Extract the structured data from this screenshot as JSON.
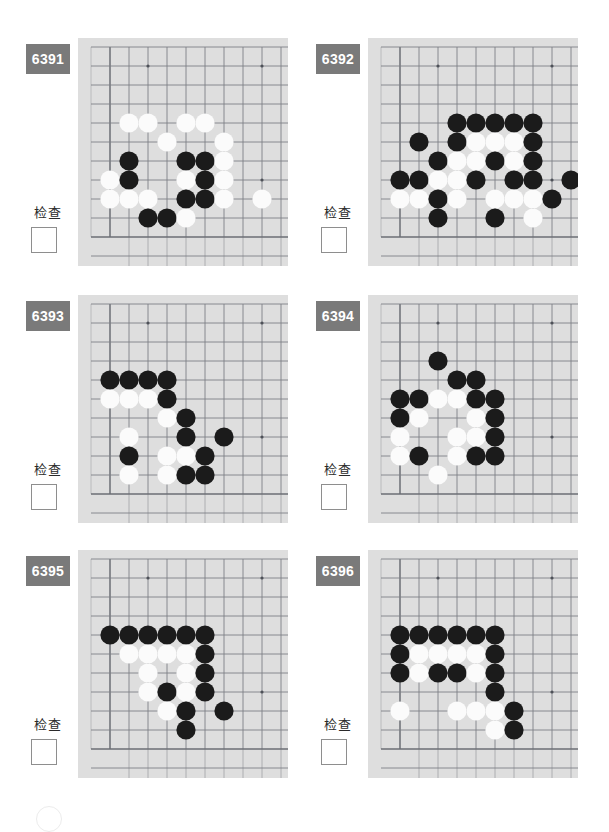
{
  "page": {
    "width": 609,
    "height": 820,
    "background": "#ffffff",
    "columns": 2,
    "rows": 3
  },
  "style": {
    "badge_bg": "#7a7a7a",
    "badge_text_color": "#ffffff",
    "board_bg": "#dedede",
    "board_line_color": "#7d8087",
    "board_edge_color": "#6b6e75",
    "stone_black": "#1b1b1b",
    "stone_white": "#fbfbfb",
    "checkbox_border": "#8e8e8e"
  },
  "board_meta": {
    "cols": 10,
    "rows": 11,
    "cell": 19,
    "stone_radius": 9.6,
    "origin_x": 13,
    "origin_y": 9,
    "edge_left_col": 1,
    "edge_bottom_row": 10,
    "star_points": [
      [
        3,
        1
      ],
      [
        9,
        1
      ],
      [
        9,
        7
      ]
    ]
  },
  "common": {
    "check_label": "检查",
    "checkbox_value": ""
  },
  "panels": [
    {
      "id": "6391",
      "label": "6391",
      "check_label": "检查",
      "x": 20,
      "y": 38,
      "stones": [
        {
          "c": 2,
          "r": 4,
          "color": "white"
        },
        {
          "c": 3,
          "r": 4,
          "color": "white"
        },
        {
          "c": 5,
          "r": 4,
          "color": "white"
        },
        {
          "c": 6,
          "r": 4,
          "color": "white"
        },
        {
          "c": 4,
          "r": 5,
          "color": "white"
        },
        {
          "c": 7,
          "r": 5,
          "color": "white"
        },
        {
          "c": 2,
          "r": 6,
          "color": "black"
        },
        {
          "c": 5,
          "r": 6,
          "color": "black"
        },
        {
          "c": 6,
          "r": 6,
          "color": "black"
        },
        {
          "c": 7,
          "r": 6,
          "color": "white"
        },
        {
          "c": 1,
          "r": 7,
          "color": "white"
        },
        {
          "c": 2,
          "r": 7,
          "color": "black"
        },
        {
          "c": 5,
          "r": 7,
          "color": "white"
        },
        {
          "c": 6,
          "r": 7,
          "color": "black"
        },
        {
          "c": 7,
          "r": 7,
          "color": "white"
        },
        {
          "c": 1,
          "r": 8,
          "color": "white"
        },
        {
          "c": 2,
          "r": 8,
          "color": "white"
        },
        {
          "c": 3,
          "r": 8,
          "color": "white"
        },
        {
          "c": 5,
          "r": 8,
          "color": "black"
        },
        {
          "c": 6,
          "r": 8,
          "color": "black"
        },
        {
          "c": 7,
          "r": 8,
          "color": "white"
        },
        {
          "c": 9,
          "r": 8,
          "color": "white"
        },
        {
          "c": 3,
          "r": 9,
          "color": "black"
        },
        {
          "c": 4,
          "r": 9,
          "color": "black"
        },
        {
          "c": 5,
          "r": 9,
          "color": "white"
        }
      ]
    },
    {
      "id": "6392",
      "label": "6392",
      "check_label": "检查",
      "x": 310,
      "y": 38,
      "stones": [
        {
          "c": 4,
          "r": 4,
          "color": "black"
        },
        {
          "c": 5,
          "r": 4,
          "color": "black"
        },
        {
          "c": 6,
          "r": 4,
          "color": "black"
        },
        {
          "c": 7,
          "r": 4,
          "color": "black"
        },
        {
          "c": 8,
          "r": 4,
          "color": "black"
        },
        {
          "c": 2,
          "r": 5,
          "color": "black"
        },
        {
          "c": 4,
          "r": 5,
          "color": "black"
        },
        {
          "c": 5,
          "r": 5,
          "color": "white"
        },
        {
          "c": 6,
          "r": 5,
          "color": "white"
        },
        {
          "c": 7,
          "r": 5,
          "color": "white"
        },
        {
          "c": 8,
          "r": 5,
          "color": "black"
        },
        {
          "c": 3,
          "r": 6,
          "color": "black"
        },
        {
          "c": 4,
          "r": 6,
          "color": "white"
        },
        {
          "c": 5,
          "r": 6,
          "color": "white"
        },
        {
          "c": 6,
          "r": 6,
          "color": "black"
        },
        {
          "c": 7,
          "r": 6,
          "color": "white"
        },
        {
          "c": 8,
          "r": 6,
          "color": "black"
        },
        {
          "c": 1,
          "r": 7,
          "color": "black"
        },
        {
          "c": 2,
          "r": 7,
          "color": "black"
        },
        {
          "c": 3,
          "r": 7,
          "color": "white"
        },
        {
          "c": 4,
          "r": 7,
          "color": "white"
        },
        {
          "c": 5,
          "r": 7,
          "color": "black"
        },
        {
          "c": 7,
          "r": 7,
          "color": "black"
        },
        {
          "c": 8,
          "r": 7,
          "color": "black"
        },
        {
          "c": 10,
          "r": 7,
          "color": "black"
        },
        {
          "c": 1,
          "r": 8,
          "color": "white"
        },
        {
          "c": 2,
          "r": 8,
          "color": "white"
        },
        {
          "c": 3,
          "r": 8,
          "color": "black"
        },
        {
          "c": 4,
          "r": 8,
          "color": "white"
        },
        {
          "c": 6,
          "r": 8,
          "color": "white"
        },
        {
          "c": 7,
          "r": 8,
          "color": "white"
        },
        {
          "c": 8,
          "r": 8,
          "color": "white"
        },
        {
          "c": 9,
          "r": 8,
          "color": "black"
        },
        {
          "c": 3,
          "r": 9,
          "color": "black"
        },
        {
          "c": 6,
          "r": 9,
          "color": "black"
        },
        {
          "c": 8,
          "r": 9,
          "color": "white"
        }
      ]
    },
    {
      "id": "6393",
      "label": "6393",
      "check_label": "检查",
      "x": 20,
      "y": 295,
      "stones": [
        {
          "c": 1,
          "r": 4,
          "color": "black"
        },
        {
          "c": 2,
          "r": 4,
          "color": "black"
        },
        {
          "c": 3,
          "r": 4,
          "color": "black"
        },
        {
          "c": 4,
          "r": 4,
          "color": "black"
        },
        {
          "c": 1,
          "r": 5,
          "color": "white"
        },
        {
          "c": 2,
          "r": 5,
          "color": "white"
        },
        {
          "c": 3,
          "r": 5,
          "color": "white"
        },
        {
          "c": 4,
          "r": 5,
          "color": "black"
        },
        {
          "c": 4,
          "r": 6,
          "color": "white"
        },
        {
          "c": 5,
          "r": 6,
          "color": "black"
        },
        {
          "c": 2,
          "r": 7,
          "color": "white"
        },
        {
          "c": 5,
          "r": 7,
          "color": "black"
        },
        {
          "c": 7,
          "r": 7,
          "color": "black"
        },
        {
          "c": 2,
          "r": 8,
          "color": "black"
        },
        {
          "c": 4,
          "r": 8,
          "color": "white"
        },
        {
          "c": 5,
          "r": 8,
          "color": "white"
        },
        {
          "c": 6,
          "r": 8,
          "color": "black"
        },
        {
          "c": 2,
          "r": 9,
          "color": "white"
        },
        {
          "c": 4,
          "r": 9,
          "color": "white"
        },
        {
          "c": 5,
          "r": 9,
          "color": "black"
        },
        {
          "c": 6,
          "r": 9,
          "color": "black"
        }
      ]
    },
    {
      "id": "6394",
      "label": "6394",
      "check_label": "检查",
      "x": 310,
      "y": 295,
      "stones": [
        {
          "c": 3,
          "r": 3,
          "color": "black"
        },
        {
          "c": 4,
          "r": 4,
          "color": "black"
        },
        {
          "c": 5,
          "r": 4,
          "color": "black"
        },
        {
          "c": 1,
          "r": 5,
          "color": "black"
        },
        {
          "c": 2,
          "r": 5,
          "color": "black"
        },
        {
          "c": 3,
          "r": 5,
          "color": "white"
        },
        {
          "c": 4,
          "r": 5,
          "color": "white"
        },
        {
          "c": 5,
          "r": 5,
          "color": "black"
        },
        {
          "c": 6,
          "r": 5,
          "color": "black"
        },
        {
          "c": 1,
          "r": 6,
          "color": "black"
        },
        {
          "c": 2,
          "r": 6,
          "color": "white"
        },
        {
          "c": 5,
          "r": 6,
          "color": "white"
        },
        {
          "c": 6,
          "r": 6,
          "color": "black"
        },
        {
          "c": 1,
          "r": 7,
          "color": "white"
        },
        {
          "c": 4,
          "r": 7,
          "color": "white"
        },
        {
          "c": 5,
          "r": 7,
          "color": "white"
        },
        {
          "c": 6,
          "r": 7,
          "color": "black"
        },
        {
          "c": 1,
          "r": 8,
          "color": "white"
        },
        {
          "c": 2,
          "r": 8,
          "color": "black"
        },
        {
          "c": 4,
          "r": 8,
          "color": "white"
        },
        {
          "c": 5,
          "r": 8,
          "color": "black"
        },
        {
          "c": 6,
          "r": 8,
          "color": "black"
        },
        {
          "c": 3,
          "r": 9,
          "color": "white"
        }
      ]
    },
    {
      "id": "6395",
      "label": "6395",
      "check_label": "检查",
      "x": 20,
      "y": 550,
      "stones": [
        {
          "c": 1,
          "r": 4,
          "color": "black"
        },
        {
          "c": 2,
          "r": 4,
          "color": "black"
        },
        {
          "c": 3,
          "r": 4,
          "color": "black"
        },
        {
          "c": 4,
          "r": 4,
          "color": "black"
        },
        {
          "c": 5,
          "r": 4,
          "color": "black"
        },
        {
          "c": 6,
          "r": 4,
          "color": "black"
        },
        {
          "c": 2,
          "r": 5,
          "color": "white"
        },
        {
          "c": 3,
          "r": 5,
          "color": "white"
        },
        {
          "c": 4,
          "r": 5,
          "color": "white"
        },
        {
          "c": 5,
          "r": 5,
          "color": "white"
        },
        {
          "c": 6,
          "r": 5,
          "color": "black"
        },
        {
          "c": 3,
          "r": 6,
          "color": "white"
        },
        {
          "c": 5,
          "r": 6,
          "color": "white"
        },
        {
          "c": 6,
          "r": 6,
          "color": "black"
        },
        {
          "c": 3,
          "r": 7,
          "color": "white"
        },
        {
          "c": 4,
          "r": 7,
          "color": "black"
        },
        {
          "c": 5,
          "r": 7,
          "color": "white"
        },
        {
          "c": 6,
          "r": 7,
          "color": "black"
        },
        {
          "c": 4,
          "r": 8,
          "color": "white"
        },
        {
          "c": 5,
          "r": 8,
          "color": "black"
        },
        {
          "c": 7,
          "r": 8,
          "color": "black"
        },
        {
          "c": 5,
          "r": 9,
          "color": "black"
        }
      ]
    },
    {
      "id": "6396",
      "label": "6396",
      "check_label": "检查",
      "x": 310,
      "y": 550,
      "stones": [
        {
          "c": 1,
          "r": 4,
          "color": "black"
        },
        {
          "c": 2,
          "r": 4,
          "color": "black"
        },
        {
          "c": 3,
          "r": 4,
          "color": "black"
        },
        {
          "c": 4,
          "r": 4,
          "color": "black"
        },
        {
          "c": 5,
          "r": 4,
          "color": "black"
        },
        {
          "c": 6,
          "r": 4,
          "color": "black"
        },
        {
          "c": 1,
          "r": 5,
          "color": "black"
        },
        {
          "c": 2,
          "r": 5,
          "color": "white"
        },
        {
          "c": 3,
          "r": 5,
          "color": "white"
        },
        {
          "c": 4,
          "r": 5,
          "color": "white"
        },
        {
          "c": 5,
          "r": 5,
          "color": "white"
        },
        {
          "c": 6,
          "r": 5,
          "color": "black"
        },
        {
          "c": 1,
          "r": 6,
          "color": "black"
        },
        {
          "c": 2,
          "r": 6,
          "color": "white"
        },
        {
          "c": 3,
          "r": 6,
          "color": "black"
        },
        {
          "c": 4,
          "r": 6,
          "color": "black"
        },
        {
          "c": 5,
          "r": 6,
          "color": "white"
        },
        {
          "c": 6,
          "r": 6,
          "color": "black"
        },
        {
          "c": 6,
          "r": 7,
          "color": "black"
        },
        {
          "c": 1,
          "r": 8,
          "color": "white"
        },
        {
          "c": 4,
          "r": 8,
          "color": "white"
        },
        {
          "c": 5,
          "r": 8,
          "color": "white"
        },
        {
          "c": 6,
          "r": 8,
          "color": "white"
        },
        {
          "c": 7,
          "r": 8,
          "color": "black"
        },
        {
          "c": 6,
          "r": 9,
          "color": "white"
        },
        {
          "c": 7,
          "r": 9,
          "color": "black"
        }
      ]
    }
  ]
}
